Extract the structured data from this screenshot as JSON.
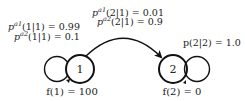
{
  "diagram": {
    "type": "markov-decision-process",
    "states": [
      {
        "id": "1",
        "label": "1",
        "reward_label": "f(1) = 100"
      },
      {
        "id": "2",
        "label": "2",
        "reward_label": "f(2) = 0"
      }
    ],
    "transitions": {
      "self_1": {
        "line1": {
          "prefix": "p",
          "sup": "a1",
          "rest": "(1|1) = 0.99"
        },
        "line2": {
          "prefix": "p",
          "sup": "a2",
          "rest": "(1|1) = 0.1"
        }
      },
      "one_to_two": {
        "line1": {
          "prefix": "p",
          "sup": "a1",
          "rest": "(2|1) = 0.01"
        },
        "line2": {
          "prefix": "p",
          "sup": "a2",
          "rest": "(2|1) = 0.9"
        }
      },
      "self_2": {
        "label": "p(2|2) = 1.0"
      }
    },
    "colors": {
      "stroke": "#111111",
      "text": "#222222",
      "background": "#ffffff"
    }
  }
}
